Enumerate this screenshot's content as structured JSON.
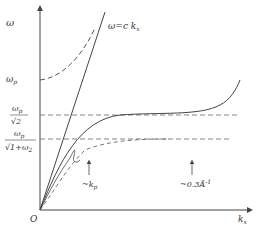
{
  "diagram": {
    "type": "dispersion-relation",
    "axes": {
      "y_label": "ω",
      "x_label": "k",
      "x_label_sub": "x",
      "origin_label": "O"
    },
    "y_ticks": {
      "omega_p": {
        "main": "ω",
        "sub": "p"
      },
      "omega_p_over_sqrt2": {
        "num": "ω",
        "num_sub": "p",
        "den": "√2"
      },
      "omega_p_over_sqrt_1_plus_eps": {
        "num": "ω",
        "num_sub": "p",
        "den": "√1+ω",
        "den_sub": "2"
      }
    },
    "light_line_label": {
      "text": "ω=c  k",
      "sub": "x"
    },
    "annotations": {
      "kp": {
        "text": "~k",
        "sub": "p"
      },
      "wavenumber": {
        "text": "~0.3Å",
        "sup": "-1"
      }
    },
    "colors": {
      "line": "#444444",
      "dashed": "#555555",
      "text": "#333333"
    }
  }
}
